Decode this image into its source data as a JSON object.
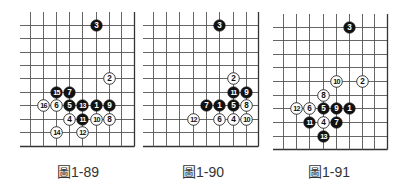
{
  "colors": {
    "grid": "#555555",
    "edge": "#333333",
    "black_stone": "#111111",
    "white_stone": "#ffffff",
    "stone_outline": "#222222",
    "caption": "#333333"
  },
  "figures": [
    {
      "caption": "圖1-89",
      "offset_x": 0,
      "grid": {
        "cols_x": [
          30,
          43,
          56,
          69,
          82,
          96,
          109,
          121,
          134
        ],
        "rows_y": [
          25,
          38,
          52,
          65,
          78,
          92,
          105,
          119,
          132,
          146
        ],
        "left_extend_x": 20,
        "top_extend_y": 12,
        "bottom_edge": true,
        "right_edge": true
      },
      "caption_x": 57,
      "stones": [
        {
          "n": "3",
          "color": "black",
          "col": 5,
          "row": 0
        },
        {
          "n": "2",
          "color": "white",
          "col": 6,
          "row": 4
        },
        {
          "n": "15",
          "color": "black",
          "col": 2,
          "row": 5
        },
        {
          "n": "7",
          "color": "black",
          "col": 3,
          "row": 5
        },
        {
          "n": "16",
          "color": "white",
          "col": 1,
          "row": 6
        },
        {
          "n": "6",
          "color": "white",
          "col": 2,
          "row": 6
        },
        {
          "n": "5",
          "color": "black",
          "col": 3,
          "row": 6
        },
        {
          "n": "13",
          "color": "black",
          "col": 4,
          "row": 6
        },
        {
          "n": "1",
          "color": "black",
          "col": 5,
          "row": 6
        },
        {
          "n": "9",
          "color": "black",
          "col": 6,
          "row": 6
        },
        {
          "n": "4",
          "color": "white",
          "col": 3,
          "row": 7
        },
        {
          "n": "11",
          "color": "black",
          "col": 4,
          "row": 7
        },
        {
          "n": "10",
          "color": "white",
          "col": 5,
          "row": 7
        },
        {
          "n": "8",
          "color": "white",
          "col": 6,
          "row": 7
        },
        {
          "n": "14",
          "color": "white",
          "col": 2,
          "row": 8
        },
        {
          "n": "12",
          "color": "white",
          "col": 4,
          "row": 8
        }
      ]
    },
    {
      "caption": "圖1-90",
      "offset_x": 0,
      "grid": {
        "cols_x": [
          153,
          166,
          179,
          193,
          206,
          219,
          233,
          246,
          258
        ],
        "rows_y": [
          25,
          38,
          52,
          65,
          78,
          92,
          105,
          119,
          132,
          146
        ],
        "left_extend_x": 143,
        "top_extend_y": 12,
        "bottom_edge": true,
        "right_edge": true
      },
      "caption_x": 182,
      "stones": [
        {
          "n": "3",
          "color": "black",
          "col": 5,
          "row": 0
        },
        {
          "n": "2",
          "color": "white",
          "col": 6,
          "row": 4
        },
        {
          "n": "11",
          "color": "black",
          "col": 6,
          "row": 5
        },
        {
          "n": "9",
          "color": "black",
          "col": 7,
          "row": 5
        },
        {
          "n": "7",
          "color": "black",
          "col": 4,
          "row": 6
        },
        {
          "n": "1",
          "color": "black",
          "col": 5,
          "row": 6
        },
        {
          "n": "5",
          "color": "black",
          "col": 6,
          "row": 6
        },
        {
          "n": "8",
          "color": "white",
          "col": 7,
          "row": 6
        },
        {
          "n": "12",
          "color": "white",
          "col": 3,
          "row": 7
        },
        {
          "n": "6",
          "color": "white",
          "col": 5,
          "row": 7
        },
        {
          "n": "4",
          "color": "white",
          "col": 6,
          "row": 7
        },
        {
          "n": "10",
          "color": "white",
          "col": 7,
          "row": 7
        }
      ]
    },
    {
      "caption": "圖1-91",
      "offset_x": 0,
      "grid": {
        "cols_x": [
          283,
          296,
          309,
          323,
          336,
          349,
          362,
          374,
          387
        ],
        "rows_y": [
          27,
          40,
          54,
          67,
          81,
          95,
          108,
          122,
          136,
          149
        ],
        "left_extend_x": 273,
        "top_extend_y": 14,
        "bottom_edge": true,
        "right_edge": true
      },
      "caption_x": 308,
      "stones": [
        {
          "n": "3",
          "color": "black",
          "col": 5,
          "row": 0
        },
        {
          "n": "10",
          "color": "white",
          "col": 4,
          "row": 4
        },
        {
          "n": "2",
          "color": "white",
          "col": 6,
          "row": 4
        },
        {
          "n": "8",
          "color": "white",
          "col": 3,
          "row": 5
        },
        {
          "n": "12",
          "color": "white",
          "col": 1,
          "row": 6
        },
        {
          "n": "6",
          "color": "white",
          "col": 2,
          "row": 6
        },
        {
          "n": "5",
          "color": "black",
          "col": 3,
          "row": 6
        },
        {
          "n": "9",
          "color": "black",
          "col": 4,
          "row": 6
        },
        {
          "n": "1",
          "color": "black",
          "col": 5,
          "row": 6
        },
        {
          "n": "11",
          "color": "black",
          "col": 2,
          "row": 7
        },
        {
          "n": "4",
          "color": "white",
          "col": 3,
          "row": 7
        },
        {
          "n": "7",
          "color": "black",
          "col": 4,
          "row": 7
        },
        {
          "n": "13",
          "color": "black",
          "col": 3,
          "row": 8
        }
      ]
    }
  ]
}
